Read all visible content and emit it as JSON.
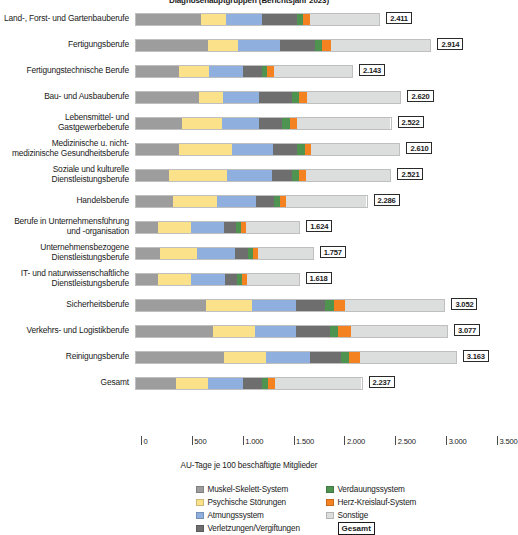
{
  "chart_data": {
    "type": "bar",
    "subtype": "stacked-horizontal",
    "title": "Diagnosehauptgruppen (Berichtsjahr 2023)",
    "xlabel": "AU-Tage je 100 beschäftigte Mitglieder",
    "ylabel": "",
    "xlim": [
      0,
      3500
    ],
    "xticks": [
      0,
      500,
      1000,
      1500,
      2000,
      2500,
      3000,
      3500
    ],
    "xtick_labels": [
      "0",
      "500",
      "1.000",
      "1.500",
      "2.000",
      "2.500",
      "3.000",
      "3.500"
    ],
    "grid": false,
    "legend_position": "bottom",
    "series": [
      {
        "name": "Muskel-Skelett-System",
        "color": "#9d9d9d"
      },
      {
        "name": "Psychische Störungen",
        "color": "#fbe28a"
      },
      {
        "name": "Atmungssystem",
        "color": "#8fb0de"
      },
      {
        "name": "Verletzungen/Vergiftungen",
        "color": "#6e6e6e"
      },
      {
        "name": "Verdauungssystem",
        "color": "#4f9350"
      },
      {
        "name": "Herz-Kreislauf-System",
        "color": "#f58220"
      },
      {
        "name": "Sonstige",
        "color": "#dcdddd"
      }
    ],
    "categories": [
      "Land-, Forst- und Gartenbauberufe",
      "Fertigungsberufe",
      "Fertigungstechnische Berufe",
      "Bau- und Ausbauberufe",
      "Lebensmittel- und Gastgewerbeberufe",
      "Medizinische u. nicht-medizinische Gesundheitsberufe",
      "Soziale und kulturelle Dienstleistungsberufe",
      "Handelsberufe",
      "Berufe in Unternehmensführung und -organisation",
      "Unternehmensbezogene Dienstleistungsberufe",
      "IT- und naturwissenschaftliche Dienstleistungsberufe",
      "Sicherheitsberufe",
      "Verkehrs- und Logistikberufe",
      "Reinigungsberufe",
      "Gesamt"
    ],
    "rows": [
      {
        "label_lines": [
          "Land-, Forst- und Gartenbauberufe"
        ],
        "total_label": "2.411",
        "total": 2411,
        "values": [
          640,
          250,
          360,
          350,
          60,
          70,
          681
        ]
      },
      {
        "label_lines": [
          "Fertigungsberufe"
        ],
        "total_label": "2.914",
        "total": 2914,
        "values": [
          710,
          300,
          420,
          340,
          70,
          95,
          979
        ]
      },
      {
        "label_lines": [
          "Fertigungstechnische Berufe"
        ],
        "total_label": "2.143",
        "total": 2143,
        "values": [
          430,
          290,
          340,
          190,
          50,
          65,
          778
        ]
      },
      {
        "label_lines": [
          "Bau- und Ausbauberufe"
        ],
        "total_label": "2.620",
        "total": 2620,
        "values": [
          620,
          240,
          360,
          330,
          65,
          80,
          925
        ]
      },
      {
        "label_lines": [
          "Lebensmittel- und Gastgewerbeberufe"
        ],
        "total_label": "2.522",
        "total": 2522,
        "values": [
          460,
          390,
          370,
          230,
          75,
          75,
          922
        ]
      },
      {
        "label_lines": [
          "Medizinische u. nicht-",
          "medizinische Gesundheitsberufe"
        ],
        "total_label": "2.610",
        "total": 2610,
        "values": [
          430,
          520,
          410,
          240,
          70,
          65,
          875
        ]
      },
      {
        "label_lines": [
          "Soziale und kulturelle",
          "Dienstleistungsberufe"
        ],
        "total_label": "2.521",
        "total": 2521,
        "values": [
          330,
          570,
          450,
          200,
          70,
          60,
          841
        ]
      },
      {
        "label_lines": [
          "Handelsberufe"
        ],
        "total_label": "2.286",
        "total": 2286,
        "values": [
          370,
          430,
          390,
          180,
          60,
          60,
          796
        ]
      },
      {
        "label_lines": [
          "Berufe in Unternehmensführung",
          "und -organisation"
        ],
        "total_label": "1.624",
        "total": 1624,
        "values": [
          220,
          330,
          330,
          120,
          50,
          50,
          524
        ]
      },
      {
        "label_lines": [
          "Unternehmensbezogene",
          "Dienstleistungsberufe"
        ],
        "total_label": "1.757",
        "total": 1757,
        "values": [
          240,
          370,
          370,
          130,
          50,
          55,
          542
        ]
      },
      {
        "label_lines": [
          "IT- und naturwissenschaftliche",
          "Dienstleistungsberufe"
        ],
        "total_label": "1.618",
        "total": 1618,
        "values": [
          220,
          330,
          340,
          120,
          50,
          50,
          508
        ]
      },
      {
        "label_lines": [
          "Sicherheitsberufe"
        ],
        "total_label": "3.052",
        "total": 3052,
        "values": [
          690,
          460,
          430,
          290,
          85,
          115,
          982
        ]
      },
      {
        "label_lines": [
          "Verkehrs- und Logistikberufe"
        ],
        "total_label": "3.077",
        "total": 3077,
        "values": [
          760,
          420,
          400,
          340,
          80,
          125,
          952
        ]
      },
      {
        "label_lines": [
          "Reinigungsberufe"
        ],
        "total_label": "3.163",
        "total": 3163,
        "values": [
          870,
          420,
          430,
          310,
          75,
          110,
          948
        ]
      },
      {
        "label_lines": [
          "Gesamt"
        ],
        "total_label": "2.237",
        "total": 2237,
        "values": [
          400,
          310,
          350,
          190,
          60,
          65,
          862
        ]
      }
    ]
  },
  "legend": {
    "left_column": [
      {
        "label": "Muskel-Skelett-System",
        "color": "#9d9d9d"
      },
      {
        "label": "Psychische Störungen",
        "color": "#fbe28a"
      },
      {
        "label": "Atmungssystem",
        "color": "#8fb0de"
      },
      {
        "label": "Verletzungen/Vergiftungen",
        "color": "#6e6e6e"
      }
    ],
    "right_column": [
      {
        "label": "Verdauungssystem",
        "color": "#4f9350"
      },
      {
        "label": "Herz-Kreislauf-System",
        "color": "#f58220"
      },
      {
        "label": "Sonstige",
        "color": "#dcdddd"
      }
    ],
    "total_badge": "Gesamt"
  }
}
